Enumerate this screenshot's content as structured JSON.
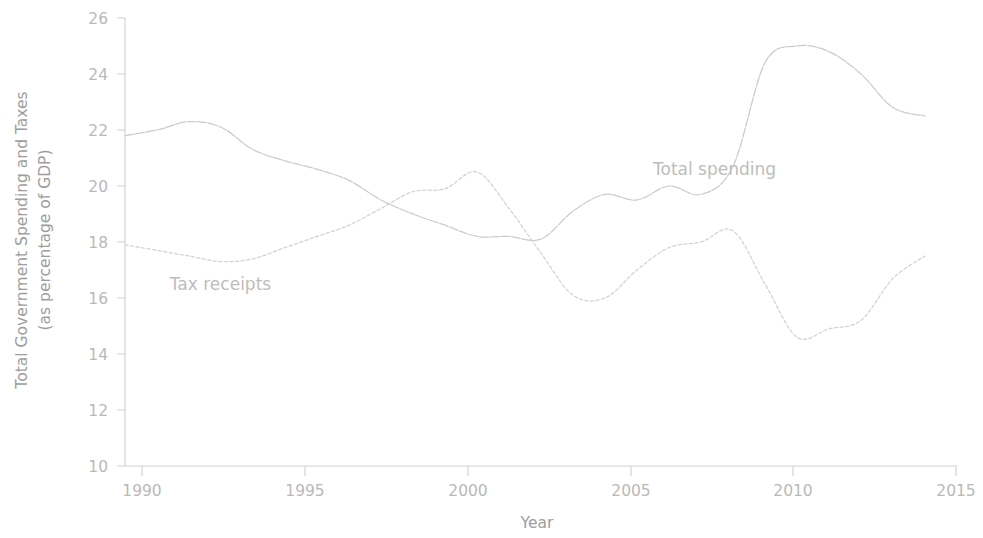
{
  "chart_data": {
    "type": "line",
    "title": "",
    "xlabel": "Year",
    "ylabel": "Total Government Spending and Taxes\n(as percentage of GDP)",
    "ylabel_line1": "Total Government Spending and Taxes",
    "ylabel_line2": "(as percentage of GDP)",
    "xlim": [
      1989,
      2015
    ],
    "ylim": [
      10,
      26
    ],
    "xticks": [
      1990,
      1995,
      2000,
      2005,
      2010,
      2015
    ],
    "yticks": [
      10,
      12,
      14,
      16,
      18,
      20,
      22,
      24,
      26
    ],
    "xtick_labels": [
      "1990",
      "1995",
      "2000",
      "2005",
      "2010",
      "2015"
    ],
    "ytick_labels": [
      "10",
      "12",
      "14",
      "16",
      "18",
      "20",
      "22",
      "24",
      "26"
    ],
    "grid": false,
    "legend_position": "inline-annotations",
    "x": [
      1989,
      1990,
      1991,
      1992,
      1993,
      1994,
      1995,
      1996,
      1997,
      1998,
      1999,
      2000,
      2001,
      2002,
      2003,
      2004,
      2005,
      2006,
      2007,
      2008,
      2009,
      2010,
      2011,
      2012,
      2013,
      2014
    ],
    "series": [
      {
        "name": "Total spending",
        "label": "Total spending",
        "color": "#cbcbcb",
        "style": "long-dash",
        "values": [
          21.8,
          22.0,
          22.3,
          22.1,
          21.3,
          20.9,
          20.6,
          20.2,
          19.5,
          19.0,
          18.6,
          18.2,
          18.2,
          18.1,
          19.1,
          19.7,
          19.5,
          20.0,
          19.7,
          20.7,
          24.4,
          25.0,
          24.8,
          24.0,
          22.8,
          22.5
        ],
        "annotation": {
          "text": "Total spending",
          "x": 2005.5,
          "y": 20.4
        }
      },
      {
        "name": "Tax receipts",
        "label": "Tax receipts",
        "color": "#d2d2d2",
        "style": "dotted",
        "values": [
          17.9,
          17.7,
          17.5,
          17.3,
          17.4,
          17.8,
          18.2,
          18.6,
          19.2,
          19.8,
          19.9,
          20.5,
          19.2,
          17.6,
          16.1,
          16.0,
          17.0,
          17.8,
          18.0,
          18.4,
          16.5,
          14.6,
          14.9,
          15.2,
          16.7,
          17.5
        ],
        "annotation": {
          "text": "Tax receipts",
          "x": 1990.4,
          "y": 16.3
        }
      }
    ]
  },
  "axes": {
    "y_title_line1": "Total Government Spending and Taxes",
    "y_title_line2": "(as percentage of GDP)",
    "x_title": "Year"
  }
}
